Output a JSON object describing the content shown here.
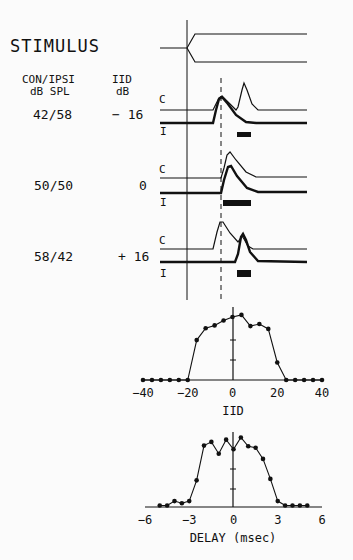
{
  "labels": {
    "stimulus": "STIMULUS",
    "col1_header_line1": "CON/IPSI",
    "col1_header_line2": "dB SPL",
    "col2_header_line1": "IID",
    "col2_header_line2": "dB",
    "contra_marker": "C",
    "ipsi_marker": "I"
  },
  "rows": [
    {
      "spl": "42/58",
      "iid": "− 16"
    },
    {
      "spl": "50/50",
      "iid": "0"
    },
    {
      "spl": "58/42",
      "iid": "+ 16"
    }
  ],
  "chart_data": [
    {
      "type": "line",
      "title": "",
      "xlabel": "IID",
      "ylabel": "",
      "xlim": [
        -40,
        40
      ],
      "xticks": [
        "-40",
        "-20",
        "0",
        "20",
        "40"
      ],
      "x": [
        -40,
        -36,
        -32,
        -28,
        -24,
        -20,
        -16,
        -12,
        -8,
        -4,
        0,
        4,
        8,
        12,
        16,
        20,
        24,
        28,
        32,
        36,
        40
      ],
      "values": [
        0,
        0,
        0,
        0,
        0,
        0,
        57,
        74,
        78,
        85,
        90,
        93,
        77,
        80,
        73,
        25,
        0,
        0,
        0,
        0,
        0
      ],
      "units": "relative response (0-100)",
      "grid": false
    },
    {
      "type": "line",
      "title": "",
      "xlabel": "DELAY (msec)",
      "ylabel": "",
      "xlim": [
        -6,
        6
      ],
      "xticks": [
        "-6",
        "-3",
        "0",
        "3",
        "6"
      ],
      "x": [
        -5,
        -4.5,
        -4,
        -3.5,
        -3,
        -2.5,
        -2,
        -1.5,
        -1,
        -0.5,
        0,
        0.5,
        1,
        1.5,
        2,
        2.5,
        3,
        3.5,
        4,
        4.5,
        5
      ],
      "values": [
        2,
        2,
        8,
        5,
        8,
        36,
        83,
        88,
        72,
        91,
        78,
        94,
        82,
        80,
        65,
        38,
        8,
        2,
        2,
        2,
        2
      ],
      "units": "relative response (0-100)",
      "grid": false
    }
  ]
}
